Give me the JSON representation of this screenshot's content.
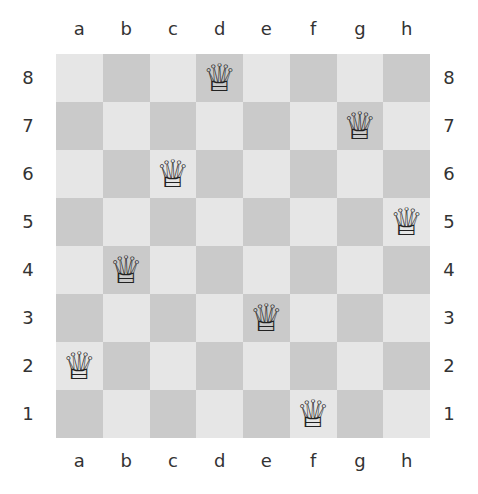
{
  "board": {
    "files": [
      "a",
      "b",
      "c",
      "d",
      "e",
      "f",
      "g",
      "h"
    ],
    "ranks": [
      "8",
      "7",
      "6",
      "5",
      "4",
      "3",
      "2",
      "1"
    ],
    "colors": {
      "light": "#e6e6e6",
      "dark": "#cacaca"
    },
    "queen_glyph": "♕",
    "queens": [
      {
        "square": "d8",
        "piece": "white-queen"
      },
      {
        "square": "g7",
        "piece": "white-queen"
      },
      {
        "square": "c6",
        "piece": "white-queen"
      },
      {
        "square": "h5",
        "piece": "white-queen"
      },
      {
        "square": "b4",
        "piece": "white-queen"
      },
      {
        "square": "e3",
        "piece": "white-queen"
      },
      {
        "square": "a2",
        "piece": "white-queen"
      },
      {
        "square": "f1",
        "piece": "white-queen"
      }
    ]
  }
}
